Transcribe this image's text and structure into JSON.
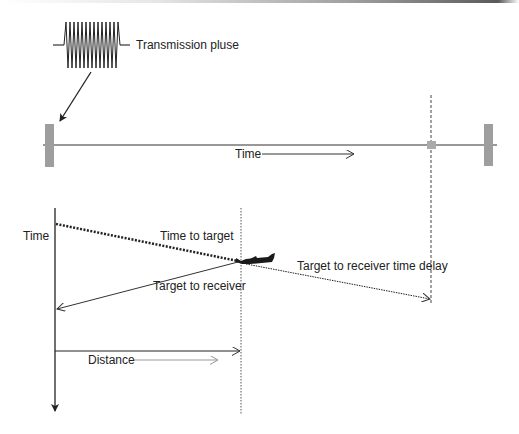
{
  "diagram": {
    "labels": {
      "transmission_pulse": "Transmission pluse",
      "time_top": "Time",
      "time_axis": "Time",
      "time_to_target": "Time to target",
      "target_to_receiver": "Target to receiver",
      "target_to_receiver_delay": "Target to receiver time delay",
      "distance": "Distance"
    },
    "colors": {
      "line": "#222222",
      "antenna_block": "#9e9e9e",
      "light_arrow": "#9a9a9a"
    },
    "icons": {
      "pulse": "sine-burst-icon",
      "aircraft": "airplane-icon",
      "transmitter": "antenna-block-icon",
      "receiver": "antenna-block-icon"
    }
  }
}
